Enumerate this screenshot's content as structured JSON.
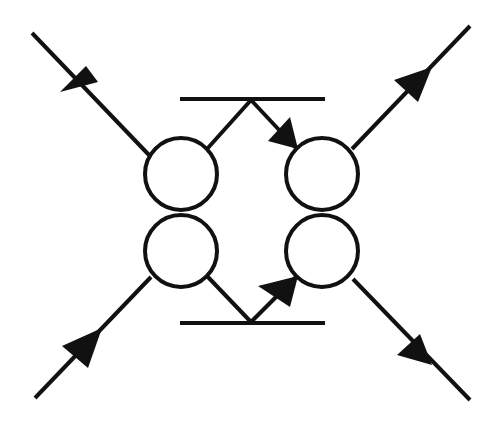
{
  "diagram": {
    "type": "feynman-like vertex diagram",
    "colors": {
      "stroke": "#111111",
      "background": "#ffffff"
    },
    "bars": [
      {
        "id": "top-bar",
        "x1": 180,
        "y1": 99,
        "x2": 325,
        "y2": 99
      },
      {
        "id": "bottom-bar",
        "x1": 180,
        "y1": 323,
        "x2": 325,
        "y2": 323
      }
    ],
    "circles": [
      {
        "id": "top-left",
        "cx": 181,
        "cy": 174,
        "r": 36
      },
      {
        "id": "bottom-left",
        "cx": 181,
        "cy": 251,
        "r": 36
      },
      {
        "id": "top-right",
        "cx": 322,
        "cy": 174,
        "r": 36
      },
      {
        "id": "bottom-right",
        "cx": 322,
        "cy": 251,
        "r": 36
      }
    ],
    "lines": [
      {
        "id": "incoming-top-left",
        "x1": 32,
        "y1": 33,
        "x2": 149,
        "y2": 155,
        "arrow": "toward-center"
      },
      {
        "id": "incoming-bottom-left",
        "x1": 35,
        "y1": 398,
        "x2": 151,
        "y2": 277,
        "arrow": "toward-center"
      },
      {
        "id": "outgoing-top-right",
        "x1": 352,
        "y1": 149,
        "x2": 470,
        "y2": 26,
        "arrow": "away-from-center"
      },
      {
        "id": "outgoing-bottom-right",
        "x1": 353,
        "y1": 279,
        "x2": 470,
        "y2": 400,
        "arrow": "away-from-center"
      },
      {
        "id": "top-left-to-top-vertex",
        "x1": 207,
        "y1": 149,
        "x2": 251,
        "y2": 100,
        "arrow": "none"
      },
      {
        "id": "top-vertex-to-top-right",
        "x1": 251,
        "y1": 100,
        "x2": 296,
        "y2": 148,
        "arrow": "toward-circle"
      },
      {
        "id": "bottom-left-to-bottom-vertex",
        "x1": 207,
        "y1": 276,
        "x2": 251,
        "y2": 322,
        "arrow": "none"
      },
      {
        "id": "bottom-vertex-to-bottom-right",
        "x1": 251,
        "y1": 322,
        "x2": 296,
        "y2": 277,
        "arrow": "toward-circle"
      }
    ],
    "arrowheads": [
      {
        "id": "arrow-incoming-top-left",
        "points": "98,82 60,92 86,66"
      },
      {
        "id": "arrow-incoming-bottom-left",
        "points": "102,328 62,346 88,368"
      },
      {
        "id": "arrow-outgoing-top-right",
        "points": "432,67 394,80 418,102"
      },
      {
        "id": "arrow-outgoing-bottom-right",
        "points": "432,365 397,355 420,334"
      },
      {
        "id": "arrow-top-right-junction",
        "points": "298,149 268,141 290,117"
      },
      {
        "id": "arrow-bottom-right-junction",
        "points": "298,276 258,286 290,307"
      }
    ]
  }
}
